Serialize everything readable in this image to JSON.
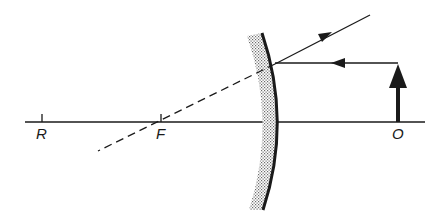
{
  "diagram": {
    "type": "convex-mirror-ray-diagram",
    "colors": {
      "ink": "#1a1a1a",
      "background": "#ffffff",
      "shading": "#9a9a9a"
    },
    "labels": {
      "R": "R",
      "F": "F",
      "O": "O"
    },
    "points": {
      "R": {
        "x": 42,
        "axis_y": 122
      },
      "F": {
        "x": 161,
        "axis_y": 122
      },
      "O": {
        "x": 398,
        "axis_y": 122
      }
    },
    "elements": [
      "optical-axis",
      "convex-mirror",
      "object-arrow",
      "incident-ray",
      "reflected-ray",
      "virtual-ray-extension"
    ]
  }
}
